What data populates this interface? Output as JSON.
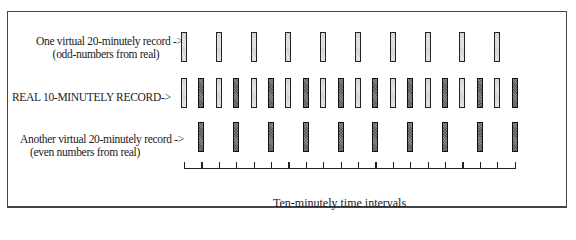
{
  "diagram": {
    "rows": [
      {
        "id": "odd",
        "label_line1": "One virtual 20-minutely record ->",
        "label_line2": "(odd-numbers from real)",
        "bar_indices": [
          1,
          3,
          5,
          7,
          9,
          11,
          13,
          15,
          17,
          19
        ],
        "bar_style": "light"
      },
      {
        "id": "real",
        "label_line1": "REAL  10-MINUTELY  RECORD->",
        "label_line2": "",
        "bar_indices": [
          1,
          2,
          3,
          4,
          5,
          6,
          7,
          8,
          9,
          10,
          11,
          12,
          13,
          14,
          15,
          16,
          17,
          18,
          19,
          20
        ],
        "bar_style": "alternating"
      },
      {
        "id": "even",
        "label_line1": "Another virtual 20-minutely record ->",
        "label_line2": "(even numbers from real)",
        "bar_indices": [
          2,
          4,
          6,
          8,
          10,
          12,
          14,
          16,
          18,
          20
        ],
        "bar_style": "dark"
      }
    ],
    "axis": {
      "tick_count": 20,
      "caption": "Ten-minutely time intervals"
    },
    "colors": {
      "light_bar_fill": "#d9d9d9",
      "dark_bar_fill": "#707070",
      "outline": "#222222",
      "frame": "#444444"
    }
  }
}
